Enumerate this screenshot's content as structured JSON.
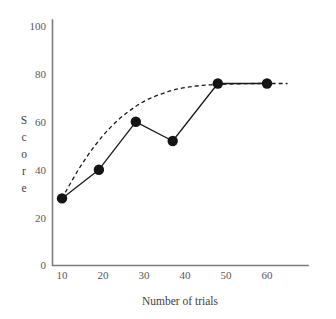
{
  "chart_data": {
    "type": "line",
    "title": "",
    "xlabel": "Number of trials",
    "ylabel": "Score",
    "xlim": [
      5,
      67
    ],
    "ylim": [
      0,
      100
    ],
    "grid": false,
    "legend": "none",
    "x_ticks": [
      "10",
      "20",
      "30",
      "40",
      "50",
      "60"
    ],
    "x_tick_values": [
      10,
      20,
      30,
      40,
      50,
      60
    ],
    "y_ticks": [
      "0",
      "20",
      "40",
      "60",
      "80",
      "100"
    ],
    "y_tick_values": [
      0,
      20,
      40,
      60,
      80,
      100
    ],
    "series": [
      {
        "name": "Observed scores",
        "style": "solid-with-markers",
        "marker": "filled-circle",
        "color": "#141414",
        "x": [
          10,
          19,
          28,
          37,
          48,
          60
        ],
        "values": [
          28,
          40,
          60,
          52,
          76,
          76
        ]
      },
      {
        "name": "Fitted learning curve",
        "style": "dashed",
        "marker": "none",
        "color": "#141414",
        "x": [
          10,
          14,
          18,
          22,
          26,
          30,
          34,
          38,
          42,
          46,
          50,
          54,
          58,
          62,
          65
        ],
        "values": [
          28,
          40,
          50,
          58,
          64,
          68.5,
          71.5,
          73.6,
          74.8,
          75.4,
          75.7,
          75.9,
          76,
          76,
          76
        ]
      }
    ],
    "annotations": []
  },
  "axis": {
    "y_letters": [
      "S",
      "c",
      "o",
      "r",
      "e"
    ]
  },
  "colors": {
    "background": "#ffffff",
    "axis": "#7c7c80",
    "ink": "#141414",
    "tick_text": "#58585a"
  }
}
